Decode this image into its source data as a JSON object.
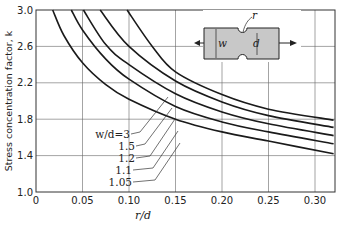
{
  "chart_data": {
    "type": "line",
    "title": "",
    "xlabel": "r/d",
    "ylabel": "Stress concentration factor, k",
    "xlim": [
      0,
      0.32
    ],
    "ylim": [
      1.0,
      3.0
    ],
    "x_ticks": [
      "0",
      "0.05",
      "0.10",
      "0.15",
      "0.20",
      "0.25",
      "0.30"
    ],
    "y_ticks": [
      "1.0",
      "1.4",
      "1.8",
      "2.2",
      "2.6",
      "3.0"
    ],
    "grid": true,
    "legend_position": "inline leader labels, lower-middle",
    "series": [
      {
        "name": "w/d=3",
        "label": "w/d=3",
        "x": [
          0.018,
          0.03,
          0.05,
          0.075,
          0.1,
          0.15,
          0.2,
          0.25,
          0.32
        ],
        "y": [
          3.0,
          2.72,
          2.42,
          2.18,
          2.02,
          1.8,
          1.66,
          1.56,
          1.42
        ]
      },
      {
        "name": "w/d=1.5",
        "label": "1.5",
        "x": [
          0.038,
          0.05,
          0.075,
          0.1,
          0.15,
          0.2,
          0.25,
          0.32
        ],
        "y": [
          3.0,
          2.78,
          2.46,
          2.24,
          1.94,
          1.77,
          1.66,
          1.53
        ]
      },
      {
        "name": "w/d=1.2",
        "label": "1.2",
        "x": [
          0.051,
          0.075,
          0.1,
          0.15,
          0.2,
          0.25,
          0.32
        ],
        "y": [
          3.0,
          2.62,
          2.4,
          2.08,
          1.88,
          1.75,
          1.62
        ]
      },
      {
        "name": "w/d=1.1",
        "label": "1.1",
        "x": [
          0.069,
          0.1,
          0.15,
          0.2,
          0.25,
          0.32
        ],
        "y": [
          3.0,
          2.6,
          2.22,
          1.99,
          1.84,
          1.71
        ]
      },
      {
        "name": "w/d=1.05",
        "label": "1.05",
        "x": [
          0.098,
          0.125,
          0.15,
          0.2,
          0.25,
          0.32
        ],
        "y": [
          3.0,
          2.6,
          2.32,
          2.07,
          1.91,
          1.79
        ]
      }
    ],
    "inset_diagram": {
      "description": "Notched flat bar in tension with semicircular notches",
      "labels": [
        "r",
        "w",
        "d"
      ]
    }
  },
  "text": {
    "ylabel": "Stress concentration factor, k",
    "xlabel": "r/d",
    "inset_r": "r",
    "inset_w": "w",
    "inset_d": "d",
    "curve_labels": [
      "w/d=3",
      "1.5",
      "1.2",
      "1.1",
      "1.05"
    ]
  },
  "colors": {
    "line": "#1a1a1a",
    "grid": "#666666",
    "inset_fill": "#c8c8c8"
  }
}
